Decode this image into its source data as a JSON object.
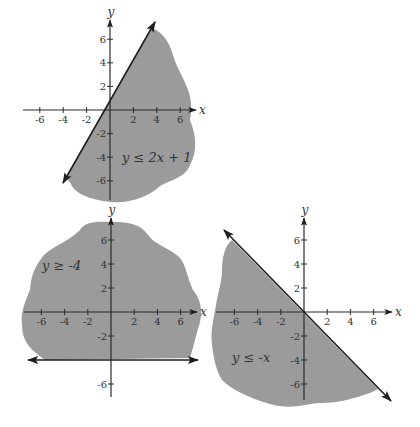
{
  "colors": {
    "region_fill": "#9b9b9b",
    "axis": "#2a2a2a",
    "boundary": "#1e1e1e",
    "text": "#333333",
    "background": "#ffffff"
  },
  "graphs": [
    {
      "id": "graph-2x-plus-1",
      "inequality_label": "y ≤ 2x + 1",
      "boundary_equation": "y = 2x + 1",
      "origin_px": [
        110,
        110
      ],
      "unit_px": [
        11.7,
        11.8
      ],
      "x_axis": {
        "from_px": 23,
        "to_px": 196,
        "label": "x",
        "ticks": [
          -6,
          -4,
          -2,
          2,
          4,
          6
        ]
      },
      "y_axis": {
        "from_px": 200,
        "to_px": 20,
        "label": "y",
        "ticks": [
          6,
          4,
          2,
          -2,
          -4,
          -6
        ]
      },
      "boundary": {
        "start_px": [
          63,
          183
        ],
        "end_px": [
          155,
          22
        ],
        "arrows": "both"
      },
      "label_px": [
        122,
        162
      ],
      "region_path": "M 152 28 C 165 33, 170 45, 174 58 C 178 70, 182 75, 186 85 C 192 98, 192 108, 190 120 C 196 135, 198 150, 190 165 C 185 178, 170 180, 160 186 C 150 196, 130 204, 110 202 C 95 200, 78 196, 72 186 C 70 182, 68 180, 66 178 Z"
    },
    {
      "id": "graph-y-ge-minus-4",
      "inequality_label": "y ≥ -4",
      "boundary_equation": "y = -4",
      "origin_px": [
        111,
        312
      ],
      "unit_px": [
        11.6,
        12.0
      ],
      "x_axis": {
        "from_px": 24,
        "to_px": 197,
        "label": "x",
        "ticks": [
          -6,
          -4,
          -2,
          2,
          4,
          6
        ]
      },
      "y_axis": {
        "from_px": 397,
        "to_px": 218,
        "label": "y",
        "ticks": [
          6,
          4,
          2,
          -2,
          -6
        ]
      },
      "boundary": {
        "start_px": [
          28,
          360
        ],
        "end_px": [
          198,
          360
        ],
        "arrows": "both"
      },
      "label_px": [
        42,
        270
      ],
      "region_path": "M 45 360 C 35 352, 22 345, 22 325 C 20 312, 26 300, 30 290 C 31 278, 33 268, 44 255 C 55 245, 68 242, 80 230 C 85 222, 95 221, 111 222 C 130 222, 140 224, 148 235 C 155 245, 170 248, 180 258 C 186 265, 188 280, 193 290 C 200 298, 203 310, 200 322 C 196 335, 194 345, 190 358 Z"
    },
    {
      "id": "graph-y-le-minus-x",
      "inequality_label": "y ≤ -x",
      "boundary_equation": "y = -x",
      "origin_px": [
        304,
        312
      ],
      "unit_px": [
        11.6,
        12.0
      ],
      "x_axis": {
        "from_px": 216,
        "to_px": 392,
        "label": "x",
        "ticks": [
          -6,
          -4,
          -2,
          2,
          4,
          6
        ]
      },
      "y_axis": {
        "from_px": 400,
        "to_px": 218,
        "label": "y",
        "ticks": [
          6,
          4,
          2,
          -2,
          -4,
          -6
        ]
      },
      "boundary": {
        "start_px": [
          224,
          230
        ],
        "end_px": [
          391,
          401
        ],
        "arrows": "both"
      },
      "label_px": [
        232,
        362
      ],
      "region_path": "M 232 240 C 225 245, 222 258, 222 270 C 222 282, 218 292, 216 305 C 214 318, 210 330, 212 345 C 214 360, 216 370, 222 380 C 232 390, 250 398, 270 404 C 290 410, 305 404, 320 403 C 340 403, 355 398, 370 393 L 378 389 Z"
    }
  ]
}
